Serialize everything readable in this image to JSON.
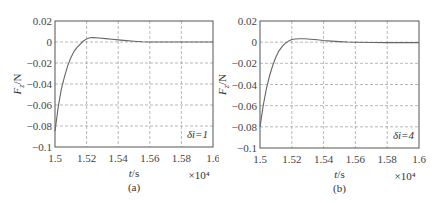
{
  "chart_data": [
    {
      "type": "line",
      "panel_label": "(a)",
      "annotation": "δi=1",
      "title": "",
      "xlabel": "t/s",
      "ylabel": "F_z/N",
      "x_multiplier": "×10⁴",
      "xlim": [
        1.5,
        1.6
      ],
      "ylim": [
        -0.1,
        0.02
      ],
      "xticks": [
        "1.5",
        "1.52",
        "1.54",
        "1.56",
        "1.58",
        "1.6"
      ],
      "yticks": [
        "0.02",
        "0",
        "-0.02",
        "-0.04",
        "-0.06",
        "-0.08",
        "-0.1"
      ],
      "grid": true,
      "series": [
        {
          "name": "F_z",
          "x": [
            1.5,
            1.502,
            1.504,
            1.506,
            1.508,
            1.51,
            1.512,
            1.514,
            1.516,
            1.518,
            1.52,
            1.522,
            1.524,
            1.528,
            1.532,
            1.536,
            1.54,
            1.545,
            1.55,
            1.555,
            1.56,
            1.57,
            1.58,
            1.59,
            1.6
          ],
          "y": [
            -0.085,
            -0.062,
            -0.045,
            -0.033,
            -0.023,
            -0.015,
            -0.009,
            -0.005,
            -0.002,
            0.001,
            0.003,
            0.004,
            0.0042,
            0.0038,
            0.0032,
            0.0026,
            0.002,
            0.0013,
            0.0008,
            0.0003,
            0.0,
            0.0,
            0.0,
            0.0,
            0.0
          ]
        }
      ]
    },
    {
      "type": "line",
      "panel_label": "(b)",
      "annotation": "δi=4",
      "title": "",
      "xlabel": "t/s",
      "ylabel": "F_z/N",
      "x_multiplier": "×10⁴",
      "xlim": [
        1.5,
        1.6
      ],
      "ylim": [
        -0.1,
        0.02
      ],
      "xticks": [
        "1.5",
        "1.52",
        "1.54",
        "1.56",
        "1.58",
        "1.6"
      ],
      "yticks": [
        "0.02",
        "0",
        "-0.02",
        "-0.04",
        "-0.06",
        "-0.08",
        "-0.1"
      ],
      "grid": true,
      "series": [
        {
          "name": "F_z",
          "x": [
            1.5,
            1.502,
            1.504,
            1.506,
            1.508,
            1.51,
            1.512,
            1.514,
            1.516,
            1.518,
            1.52,
            1.522,
            1.525,
            1.528,
            1.532,
            1.536,
            1.54,
            1.545,
            1.55,
            1.555,
            1.56,
            1.57,
            1.58,
            1.59,
            1.6
          ],
          "y": [
            -0.08,
            -0.06,
            -0.044,
            -0.032,
            -0.022,
            -0.014,
            -0.008,
            -0.004,
            -0.001,
            0.001,
            0.0025,
            0.003,
            0.0033,
            0.0032,
            0.0028,
            0.0022,
            0.0016,
            0.001,
            0.0005,
            0.0002,
            0.0,
            -0.0003,
            -0.0004,
            -0.0004,
            -0.0004
          ]
        }
      ]
    }
  ]
}
